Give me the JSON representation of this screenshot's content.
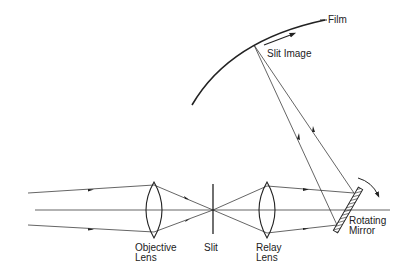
{
  "labels": {
    "film": "Film",
    "slit_image": "Slit Image",
    "objective_line1": "Objective",
    "objective_line2": "Lens",
    "slit": "Slit",
    "relay_line1": "Relay",
    "relay_line2": "Lens",
    "mirror_line1": "Rotating",
    "mirror_line2": "Mirror"
  },
  "components": [
    {
      "name": "Objective Lens",
      "type": "convex-lens"
    },
    {
      "name": "Slit",
      "type": "aperture"
    },
    {
      "name": "Relay Lens",
      "type": "convex-lens"
    },
    {
      "name": "Rotating Mirror",
      "type": "mirror"
    },
    {
      "name": "Film",
      "type": "curved-surface"
    }
  ],
  "colors": {
    "line": "#222222",
    "background": "#ffffff"
  }
}
